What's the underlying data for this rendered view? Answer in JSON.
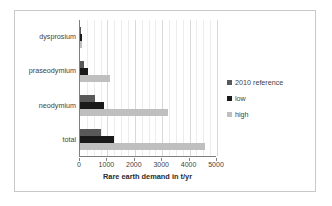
{
  "chart_data": {
    "type": "bar",
    "orientation": "horizontal",
    "title": "",
    "xlabel": "Rare earth demand in t/yr",
    "ylabel": "",
    "xlim": [
      0,
      5000
    ],
    "xticks": [
      0,
      1000,
      2000,
      3000,
      4000,
      5000
    ],
    "xtick_labels": [
      "0",
      "1000",
      "2000",
      "3000",
      "4000",
      "5000"
    ],
    "grid": true,
    "legend_position": "right",
    "categories": [
      "dysprosium",
      "praseodymium",
      "neodymium",
      "total"
    ],
    "series": [
      {
        "name": "2010 reference",
        "color": "#595959",
        "values": [
          40,
          150,
          550,
          750
        ]
      },
      {
        "name": "low",
        "color": "#1a1a1a",
        "values": [
          60,
          300,
          880,
          1250
        ]
      },
      {
        "name": "high",
        "color": "#bfbfbf",
        "values": [
          90,
          1100,
          3200,
          4550
        ]
      }
    ]
  },
  "legend": {
    "items": [
      {
        "label": "2010 reference",
        "color": "#595959"
      },
      {
        "label": "low",
        "color": "#1a1a1a"
      },
      {
        "label": "high",
        "color": "#bfbfbf"
      }
    ]
  }
}
